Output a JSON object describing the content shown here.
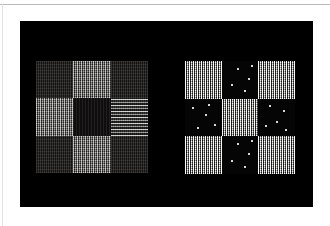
{
  "page": {
    "background_color": "#ffffff",
    "rule_color": "#b9b9b9",
    "left_rule_color": "#e2e2e2"
  },
  "figure": {
    "panel_background": "#000000",
    "panel_label": "texture-comparison-figure",
    "patterns": [
      {
        "id": "left",
        "name": "low-contrast-checkerboard",
        "rows": 3,
        "columns": 3,
        "cells": [
          {
            "row": 0,
            "col": 0,
            "type": "dark-noise",
            "mean_luminance": 30
          },
          {
            "row": 0,
            "col": 1,
            "type": "plaid-mid",
            "mean_luminance": 110
          },
          {
            "row": 0,
            "col": 2,
            "type": "dark-noise",
            "mean_luminance": 30
          },
          {
            "row": 1,
            "col": 0,
            "type": "plaid-mid",
            "mean_luminance": 110
          },
          {
            "row": 1,
            "col": 1,
            "type": "near-black",
            "mean_luminance": 21
          },
          {
            "row": 1,
            "col": 2,
            "type": "plaid-horiz",
            "mean_luminance": 95
          },
          {
            "row": 2,
            "col": 0,
            "type": "dark-noise",
            "mean_luminance": 30
          },
          {
            "row": 2,
            "col": 1,
            "type": "plaid-mid",
            "mean_luminance": 110
          },
          {
            "row": 2,
            "col": 2,
            "type": "dark-noise",
            "mean_luminance": 30
          }
        ]
      },
      {
        "id": "right",
        "name": "high-contrast-checkerboard",
        "rows": 3,
        "columns": 3,
        "cells": [
          {
            "row": 0,
            "col": 0,
            "type": "plaid-bright",
            "mean_luminance": 185
          },
          {
            "row": 0,
            "col": 1,
            "type": "sparse-dots",
            "mean_luminance": 8
          },
          {
            "row": 0,
            "col": 2,
            "type": "plaid-bright",
            "mean_luminance": 185
          },
          {
            "row": 1,
            "col": 0,
            "type": "sparse-dots",
            "mean_luminance": 8
          },
          {
            "row": 1,
            "col": 1,
            "type": "plaid-bright",
            "mean_luminance": 185
          },
          {
            "row": 1,
            "col": 2,
            "type": "sparse-dots",
            "mean_luminance": 8
          },
          {
            "row": 2,
            "col": 0,
            "type": "plaid-bright",
            "mean_luminance": 185
          },
          {
            "row": 2,
            "col": 1,
            "type": "sparse-dots",
            "mean_luminance": 8
          },
          {
            "row": 2,
            "col": 2,
            "type": "plaid-bright",
            "mean_luminance": 185
          }
        ],
        "dot_positions": [
          [
            [
              42,
              18
            ],
            [
              72,
              44
            ],
            [
              26,
              62
            ],
            [
              60,
              78
            ],
            [
              80,
              10
            ]
          ],
          [
            [
              20,
              22
            ],
            [
              55,
              40
            ],
            [
              78,
              66
            ],
            [
              34,
              74
            ],
            [
              64,
              14
            ]
          ],
          [
            [
              30,
              16
            ],
            [
              68,
              30
            ],
            [
              48,
              58
            ],
            [
              18,
              70
            ],
            [
              74,
              80
            ]
          ]
        ]
      }
    ]
  }
}
